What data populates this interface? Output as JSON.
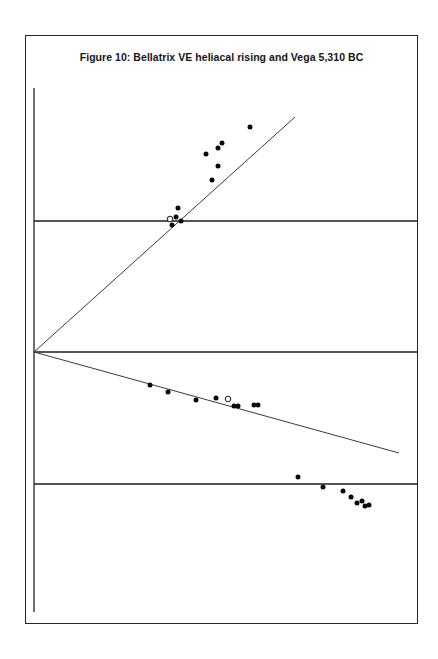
{
  "figure": {
    "title": "Figure 10: Bellatrix VE heliacal rising and Vega 5,310 BC",
    "frame_color": "#252525",
    "background": "#ffffff"
  },
  "chart_data": {
    "type": "scatter",
    "title": "Figure 10: Bellatrix VE heliacal rising and Vega 5,310 BC",
    "xlabel": "",
    "ylabel": "",
    "xlim": [
      34,
      418
    ],
    "ylim": [
      624,
      35
    ],
    "grid": false,
    "legend": null,
    "axes": {
      "vertical_axis": {
        "x": 34,
        "y_top": 88,
        "y_bottom": 612
      },
      "horizontal_reference_lines": [
        {
          "name": "upper-reference-line",
          "y": 221,
          "x_start": 34,
          "x_end": 418
        },
        {
          "name": "origin-reference-line",
          "y": 352,
          "x_start": 34,
          "x_end": 418
        },
        {
          "name": "lower-reference-line",
          "y": 484,
          "x_start": 34,
          "x_end": 418
        }
      ]
    },
    "rays": [
      {
        "name": "bellatrix-rising-ray",
        "label": "ascending sight line",
        "x1": 34,
        "y1": 352,
        "x2": 295,
        "y2": 117
      },
      {
        "name": "vega-setting-ray",
        "label": "descending sight line",
        "x1": 34,
        "y1": 352,
        "x2": 399,
        "y2": 453
      }
    ],
    "series": [
      {
        "name": "upper-filled-markers",
        "marker": "filled-circle",
        "color": "#080808",
        "points": [
          {
            "x": 172,
            "y": 225
          },
          {
            "x": 176,
            "y": 217
          },
          {
            "x": 178,
            "y": 208
          },
          {
            "x": 181,
            "y": 221
          },
          {
            "x": 212,
            "y": 180
          },
          {
            "x": 206,
            "y": 154
          },
          {
            "x": 218,
            "y": 148
          },
          {
            "x": 218,
            "y": 166
          },
          {
            "x": 222,
            "y": 143
          },
          {
            "x": 250,
            "y": 127
          }
        ]
      },
      {
        "name": "upper-open-marker",
        "marker": "open-circle",
        "color": "#ffffff",
        "points": [
          {
            "x": 170,
            "y": 219
          }
        ]
      },
      {
        "name": "descending-filled-markers",
        "marker": "filled-circle",
        "color": "#080808",
        "points": [
          {
            "x": 150,
            "y": 385
          },
          {
            "x": 168,
            "y": 392
          },
          {
            "x": 196,
            "y": 400
          },
          {
            "x": 216,
            "y": 398
          },
          {
            "x": 234,
            "y": 406
          },
          {
            "x": 238,
            "y": 406
          },
          {
            "x": 254,
            "y": 405
          },
          {
            "x": 258,
            "y": 405
          }
        ]
      },
      {
        "name": "descending-open-marker",
        "marker": "open-circle",
        "color": "#ffffff",
        "points": [
          {
            "x": 228,
            "y": 399
          }
        ]
      },
      {
        "name": "lower-filled-markers",
        "marker": "filled-circle",
        "color": "#080808",
        "points": [
          {
            "x": 298,
            "y": 477
          },
          {
            "x": 323,
            "y": 487
          },
          {
            "x": 343,
            "y": 491
          },
          {
            "x": 351,
            "y": 497
          },
          {
            "x": 357,
            "y": 503
          },
          {
            "x": 362,
            "y": 501
          },
          {
            "x": 365,
            "y": 506
          },
          {
            "x": 369,
            "y": 505
          }
        ]
      }
    ]
  }
}
